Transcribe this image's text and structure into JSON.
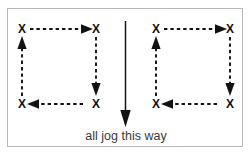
{
  "diagram": {
    "title": "all jog this way",
    "caption": "all jog this way",
    "marker_label": "X",
    "colors": {
      "ink": "#121212",
      "caption": "#3a3a3a",
      "frame": "#b9b9b9",
      "background": "#ffffff"
    },
    "center_arrow": {
      "direction": "down",
      "style": "solid",
      "label": "all jog this way"
    },
    "circuits": [
      {
        "name": "left-circuit",
        "rotation": "clockwise",
        "markers": [
          {
            "position": "top-left",
            "label": "X"
          },
          {
            "position": "top-right",
            "label": "X"
          },
          {
            "position": "bottom-right",
            "label": "X"
          },
          {
            "position": "bottom-left",
            "label": "X"
          }
        ],
        "segments": [
          {
            "name": "top-segment",
            "direction": "right",
            "style": "dashed"
          },
          {
            "name": "right-segment",
            "direction": "down",
            "style": "dashed"
          },
          {
            "name": "bottom-segment",
            "direction": "left",
            "style": "dashed"
          },
          {
            "name": "left-segment",
            "direction": "up",
            "style": "dashed"
          }
        ]
      },
      {
        "name": "right-circuit",
        "rotation": "clockwise",
        "markers": [
          {
            "position": "top-left",
            "label": "X"
          },
          {
            "position": "top-right",
            "label": "X"
          },
          {
            "position": "bottom-right",
            "label": "X"
          },
          {
            "position": "bottom-left",
            "label": "X"
          }
        ],
        "segments": [
          {
            "name": "top-segment",
            "direction": "right",
            "style": "dashed"
          },
          {
            "name": "right-segment",
            "direction": "down",
            "style": "dashed"
          },
          {
            "name": "bottom-segment",
            "direction": "left",
            "style": "dashed"
          },
          {
            "name": "left-segment",
            "direction": "up",
            "style": "dashed"
          }
        ]
      }
    ]
  }
}
